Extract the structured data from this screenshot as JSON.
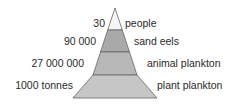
{
  "diagram": {
    "type": "pyramid of numbers",
    "levels": [
      {
        "count": "30",
        "organism": "people",
        "fill": "#f4f4f4"
      },
      {
        "count": "90 000",
        "organism": "sand eels",
        "fill": "#a9a9a9"
      },
      {
        "count": "27 000 000",
        "organism": "animal plankton",
        "fill": "#b8b8b8"
      },
      {
        "count": "1000 tonnes",
        "organism": "plant plankton",
        "fill": "#c6c6c6"
      }
    ],
    "outline_color": "#555555"
  }
}
